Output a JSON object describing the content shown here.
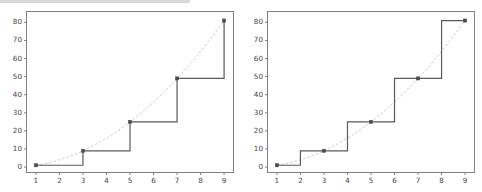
{
  "figure": {
    "background_color": "#ffffff",
    "panel_count": 2,
    "step_line_color": "#5a5a5a",
    "reference_curve_color": "#c8c8c8",
    "marker_color": "#4a4a4a",
    "axis_color": "#808080",
    "tick_label_color": "#444444"
  },
  "chart_data": [
    {
      "type": "line",
      "title": "",
      "xlabel": "",
      "ylabel": "",
      "step_mode": "post",
      "x": [
        1,
        3,
        5,
        7,
        9
      ],
      "values": [
        1,
        9,
        25,
        49,
        81
      ],
      "series": [
        {
          "name": "step-post",
          "style": "step-post",
          "x": [
            1,
            3,
            5,
            7,
            9
          ],
          "values": [
            1,
            9,
            25,
            49,
            81
          ]
        },
        {
          "name": "reference",
          "style": "dashed-curve",
          "x": [
            1,
            3,
            5,
            7,
            9
          ],
          "values": [
            1,
            9,
            25,
            49,
            81
          ]
        }
      ],
      "markers": [
        {
          "x": 1,
          "y": 1
        },
        {
          "x": 3,
          "y": 9
        },
        {
          "x": 5,
          "y": 25
        },
        {
          "x": 7,
          "y": 49
        },
        {
          "x": 9,
          "y": 81
        }
      ],
      "xlim": [
        0.6,
        9.4
      ],
      "ylim": [
        -3,
        86
      ],
      "xticks": [
        1,
        2,
        3,
        4,
        5,
        6,
        7,
        8,
        9
      ],
      "xticklabels": [
        "1",
        "2",
        "3",
        "4",
        "5",
        "6",
        "7",
        "8",
        "9"
      ],
      "yticks": [
        0,
        10,
        20,
        30,
        40,
        50,
        60,
        70,
        80
      ],
      "yticklabels": [
        "0",
        "10",
        "20",
        "30",
        "40",
        "50",
        "60",
        "70",
        "80"
      ],
      "grid": false,
      "legend": "none"
    },
    {
      "type": "line",
      "title": "",
      "xlabel": "",
      "ylabel": "",
      "step_mode": "mid",
      "x": [
        1,
        3,
        5,
        7,
        9
      ],
      "values": [
        1,
        9,
        25,
        49,
        81
      ],
      "series": [
        {
          "name": "step-mid",
          "style": "step-mid",
          "x": [
            1,
            3,
            5,
            7,
            9
          ],
          "values": [
            1,
            9,
            25,
            49,
            81
          ]
        },
        {
          "name": "reference",
          "style": "dashed-curve",
          "x": [
            1,
            3,
            5,
            7,
            9
          ],
          "values": [
            1,
            9,
            25,
            49,
            81
          ]
        }
      ],
      "markers": [
        {
          "x": 1,
          "y": 1
        },
        {
          "x": 3,
          "y": 9
        },
        {
          "x": 5,
          "y": 25
        },
        {
          "x": 7,
          "y": 49
        },
        {
          "x": 9,
          "y": 81
        }
      ],
      "xlim": [
        0.6,
        9.4
      ],
      "ylim": [
        -3,
        86
      ],
      "xticks": [
        1,
        2,
        3,
        4,
        5,
        6,
        7,
        8,
        9
      ],
      "xticklabels": [
        "1",
        "2",
        "3",
        "4",
        "5",
        "6",
        "7",
        "8",
        "9"
      ],
      "yticks": [
        0,
        10,
        20,
        30,
        40,
        50,
        60,
        70,
        80
      ],
      "yticklabels": [
        "0",
        "10",
        "20",
        "30",
        "40",
        "50",
        "60",
        "70",
        "80"
      ],
      "grid": false,
      "legend": "none"
    }
  ]
}
